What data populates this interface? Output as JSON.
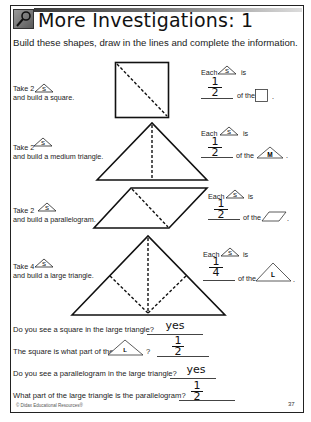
{
  "header": {
    "icon": "magnifier-icon",
    "title": "More Investigations: 1"
  },
  "instructions": "Build these shapes, draw in the lines and complete the information.",
  "tasks": [
    {
      "take_label": "Take 2",
      "piece_label": "S",
      "build_label": "and build a square.",
      "each_label": "Each",
      "is_label": "is",
      "answer_numerator": "1",
      "answer_denominator": "2",
      "of_the_label": "of the",
      "target_shape": "square",
      "period": "."
    },
    {
      "take_label": "Take 2",
      "piece_label": "S",
      "build_label": "and build a medium triangle.",
      "each_label": "Each",
      "is_label": "is",
      "answer_numerator": "1",
      "answer_denominator": "2",
      "of_the_label": "of the",
      "target_shape": "medium-triangle",
      "target_label": "M",
      "period": "."
    },
    {
      "take_label": "Take 2",
      "piece_label": "S",
      "build_label": "and build a parallelogram.",
      "each_label": "Each",
      "is_label": "is",
      "answer_numerator": "1",
      "answer_denominator": "2",
      "of_the_label": "of the",
      "target_shape": "parallelogram",
      "period": "."
    },
    {
      "take_label": "Take 4",
      "piece_label": "S",
      "build_label": "and build a large triangle.",
      "each_label": "Each",
      "is_label": "is",
      "answer_numerator": "1",
      "answer_denominator": "4",
      "of_the_label": "of the",
      "target_shape": "large-triangle",
      "target_label": "L",
      "period": "."
    }
  ],
  "questions": [
    {
      "text": "Do you see a square in the large triangle?",
      "answer": "yes"
    },
    {
      "text_before": "The square is what part of the",
      "shape_label": "L",
      "text_after": "?",
      "answer_numerator": "1",
      "answer_denominator": "2"
    },
    {
      "text": "Do you see a parallelogram in the large triangle?",
      "answer": "yes"
    },
    {
      "text": "What part of the large triangle is the parallelogram?",
      "answer_numerator": "1",
      "answer_denominator": "2"
    }
  ],
  "footer": {
    "copyright": "© Didax Educational Resources®",
    "page_number": "37"
  }
}
